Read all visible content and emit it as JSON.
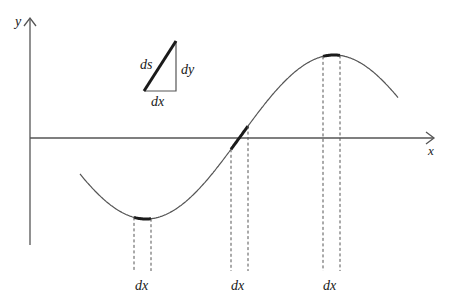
{
  "figure": {
    "axes": {
      "x_label": "x",
      "y_label": "y"
    },
    "triangle": {
      "hypotenuse_label": "ds",
      "vertical_label": "dy",
      "horizontal_label": "dx"
    },
    "curve": {
      "type": "sine-like",
      "features": [
        "minimum",
        "zero-crossing",
        "maximum"
      ]
    },
    "intervals": [
      {
        "location": "minimum",
        "label": "dx"
      },
      {
        "location": "zero-crossing",
        "label": "dx"
      },
      {
        "location": "maximum",
        "label": "dx"
      }
    ],
    "colors": {
      "ink": "#1a1a1a",
      "line": "#555555",
      "background": "#ffffff"
    }
  }
}
